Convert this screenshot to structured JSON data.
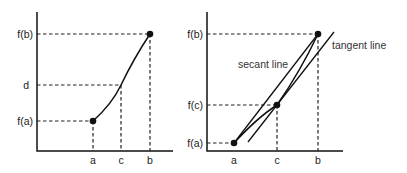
{
  "left_diagram": {
    "y_labels": {
      "fb": "f(b)",
      "d": "d",
      "fa": "f(a)"
    },
    "x_labels": {
      "a": "a",
      "c": "c",
      "b": "b"
    }
  },
  "right_diagram": {
    "y_labels": {
      "fb": "f(b)",
      "fc": "f(c)",
      "fa": "f(a)"
    },
    "x_labels": {
      "a": "a",
      "c": "c",
      "b": "b"
    },
    "annotations": {
      "secant": "secant line",
      "tangent": "tangent line"
    }
  },
  "colors": {
    "stroke": "#111111",
    "background": "#ffffff"
  }
}
